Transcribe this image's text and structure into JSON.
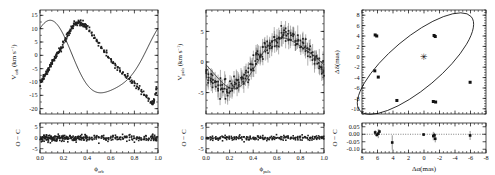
{
  "figure": {
    "type": "multi-panel-scientific-figure",
    "panel_count": 3,
    "marker_color": "#1f1f1f",
    "curve_color": "#000000",
    "background": "#ffffff"
  },
  "chart_data": [
    {
      "type": "scatter",
      "id": "orbital-radial-velocity",
      "title": "",
      "xlabel": "ϕ",
      "xlabel_sub": "orb",
      "ylabel": "V",
      "ylabel_sub": "orb",
      "ylabel_unit": " (km s",
      "ylabel_unit_sup": "−1",
      "ylabel_unit_tail": ")",
      "xlim": [
        0.0,
        1.0
      ],
      "ylim": [
        -22,
        17
      ],
      "xticks": [
        "0.0",
        "0.2",
        "0.4",
        "0.6",
        "0.8",
        "1.0"
      ],
      "xtick_values": [
        0.0,
        0.2,
        0.4,
        0.6,
        0.8,
        1.0
      ],
      "yticks": [
        "15",
        "10",
        "5",
        "0",
        "-5",
        "-10",
        "-15",
        "-20"
      ],
      "ytick_values": [
        15,
        10,
        5,
        0,
        -5,
        -10,
        -15,
        -20
      ],
      "grid": false,
      "legend": false,
      "model_curve": {
        "description": "eccentric orbit radial velocity curve",
        "amplitude": 15.5,
        "gamma": -2.5,
        "phase_offset": 0.07,
        "eccentricity": 0.25
      },
      "points": [
        {
          "x": 0.005,
          "y": -10.4
        },
        {
          "x": 0.012,
          "y": -9.9
        },
        {
          "x": 0.02,
          "y": -9.2
        },
        {
          "x": 0.028,
          "y": -8.6
        },
        {
          "x": 0.035,
          "y": -8.0
        },
        {
          "x": 0.043,
          "y": -7.4
        },
        {
          "x": 0.05,
          "y": -6.8
        },
        {
          "x": 0.058,
          "y": -6.2
        },
        {
          "x": 0.066,
          "y": -5.6
        },
        {
          "x": 0.074,
          "y": -5.0
        },
        {
          "x": 0.082,
          "y": -4.4
        },
        {
          "x": 0.09,
          "y": -3.8
        },
        {
          "x": 0.098,
          "y": -3.1
        },
        {
          "x": 0.106,
          "y": -2.6
        },
        {
          "x": 0.114,
          "y": -2.0
        },
        {
          "x": 0.122,
          "y": -1.4
        },
        {
          "x": 0.13,
          "y": -0.8
        },
        {
          "x": 0.14,
          "y": 0.0
        },
        {
          "x": 0.15,
          "y": 0.7
        },
        {
          "x": 0.16,
          "y": 1.5
        },
        {
          "x": 0.17,
          "y": 2.2
        },
        {
          "x": 0.18,
          "y": 3.0
        },
        {
          "x": 0.19,
          "y": 3.8
        },
        {
          "x": 0.2,
          "y": 4.6
        },
        {
          "x": 0.21,
          "y": 5.5
        },
        {
          "x": 0.22,
          "y": 6.3
        },
        {
          "x": 0.23,
          "y": 7.2
        },
        {
          "x": 0.24,
          "y": 8.0
        },
        {
          "x": 0.25,
          "y": 8.8
        },
        {
          "x": 0.26,
          "y": 9.5
        },
        {
          "x": 0.27,
          "y": 10.2
        },
        {
          "x": 0.28,
          "y": 10.8
        },
        {
          "x": 0.29,
          "y": 11.3
        },
        {
          "x": 0.3,
          "y": 11.7
        },
        {
          "x": 0.31,
          "y": 12.0
        },
        {
          "x": 0.32,
          "y": 12.2
        },
        {
          "x": 0.33,
          "y": 12.3
        },
        {
          "x": 0.34,
          "y": 12.3
        },
        {
          "x": 0.35,
          "y": 12.2
        },
        {
          "x": 0.36,
          "y": 12.0
        },
        {
          "x": 0.37,
          "y": 11.7
        },
        {
          "x": 0.38,
          "y": 11.3
        },
        {
          "x": 0.39,
          "y": 10.9
        },
        {
          "x": 0.4,
          "y": 10.4
        },
        {
          "x": 0.42,
          "y": 9.3
        },
        {
          "x": 0.44,
          "y": 8.1
        },
        {
          "x": 0.46,
          "y": 6.8
        },
        {
          "x": 0.48,
          "y": 5.5
        },
        {
          "x": 0.5,
          "y": 4.2
        },
        {
          "x": 0.52,
          "y": 2.9
        },
        {
          "x": 0.54,
          "y": 1.6
        },
        {
          "x": 0.56,
          "y": 0.4
        },
        {
          "x": 0.58,
          "y": -0.8
        },
        {
          "x": 0.6,
          "y": -1.9
        },
        {
          "x": 0.62,
          "y": -2.9
        },
        {
          "x": 0.64,
          "y": -3.9
        },
        {
          "x": 0.66,
          "y": -4.8
        },
        {
          "x": 0.68,
          "y": -5.7
        },
        {
          "x": 0.7,
          "y": -6.5
        },
        {
          "x": 0.72,
          "y": -7.3
        },
        {
          "x": 0.74,
          "y": -8.1
        },
        {
          "x": 0.76,
          "y": -8.9
        },
        {
          "x": 0.78,
          "y": -9.7
        },
        {
          "x": 0.8,
          "y": -10.6
        },
        {
          "x": 0.82,
          "y": -11.5
        },
        {
          "x": 0.84,
          "y": -12.5
        },
        {
          "x": 0.86,
          "y": -13.5
        },
        {
          "x": 0.88,
          "y": -14.6
        },
        {
          "x": 0.9,
          "y": -15.7
        },
        {
          "x": 0.92,
          "y": -16.8
        },
        {
          "x": 0.94,
          "y": -17.6
        },
        {
          "x": 0.95,
          "y": -17.9
        },
        {
          "x": 0.96,
          "y": -17.6
        },
        {
          "x": 0.97,
          "y": -16.6
        },
        {
          "x": 0.98,
          "y": -14.8
        },
        {
          "x": 0.99,
          "y": -12.6
        }
      ],
      "scatter_sigma": 0.9,
      "cluster_density": 4,
      "residual": {
        "ylabel": "O − C",
        "ylim": [
          -7,
          7
        ],
        "yticks": [
          "5",
          "0",
          "-5"
        ],
        "ytick_values": [
          5,
          0,
          -5
        ],
        "rms": 1.3
      }
    },
    {
      "type": "scatter",
      "id": "pulsation-radial-velocity",
      "title": "",
      "xlabel": "ϕ",
      "xlabel_sub": "puls",
      "ylabel": "V",
      "ylabel_sub": "puls",
      "ylabel_unit": " (km s",
      "ylabel_unit_sup": "−1",
      "ylabel_unit_tail": ")",
      "xlim": [
        0.0,
        1.0
      ],
      "ylim": [
        -8.5,
        8.5
      ],
      "xticks": [
        "0.0",
        "0.2",
        "0.4",
        "0.6",
        "0.8",
        "1.0"
      ],
      "xtick_values": [
        0.0,
        0.2,
        0.4,
        0.6,
        0.8,
        1.0
      ],
      "yticks": [
        "5",
        "0",
        "-5"
      ],
      "ytick_values": [
        5,
        0,
        -5
      ],
      "grid": false,
      "legend": false,
      "model_curve": {
        "description": "pulsational radial velocity curve",
        "amplitude": 4.3,
        "mean": 0.1,
        "min_phase": 0.2,
        "max_phase": 0.7
      },
      "points": [
        {
          "x": 0.005,
          "y": -1.9
        },
        {
          "x": 0.02,
          "y": -2.3
        },
        {
          "x": 0.04,
          "y": -2.8
        },
        {
          "x": 0.06,
          "y": -3.2
        },
        {
          "x": 0.08,
          "y": -3.6
        },
        {
          "x": 0.1,
          "y": -3.9
        },
        {
          "x": 0.12,
          "y": -4.1
        },
        {
          "x": 0.14,
          "y": -4.3
        },
        {
          "x": 0.16,
          "y": -4.4
        },
        {
          "x": 0.18,
          "y": -4.4
        },
        {
          "x": 0.2,
          "y": -4.3
        },
        {
          "x": 0.22,
          "y": -4.2
        },
        {
          "x": 0.24,
          "y": -4.0
        },
        {
          "x": 0.26,
          "y": -3.7
        },
        {
          "x": 0.28,
          "y": -3.3
        },
        {
          "x": 0.3,
          "y": -2.9
        },
        {
          "x": 0.32,
          "y": -2.4
        },
        {
          "x": 0.34,
          "y": -1.9
        },
        {
          "x": 0.36,
          "y": -1.4
        },
        {
          "x": 0.38,
          "y": -0.9
        },
        {
          "x": 0.4,
          "y": -0.4
        },
        {
          "x": 0.42,
          "y": 0.2
        },
        {
          "x": 0.44,
          "y": 0.7
        },
        {
          "x": 0.46,
          "y": 1.2
        },
        {
          "x": 0.48,
          "y": 1.7
        },
        {
          "x": 0.5,
          "y": 2.1
        },
        {
          "x": 0.52,
          "y": 2.5
        },
        {
          "x": 0.54,
          "y": 2.9
        },
        {
          "x": 0.56,
          "y": 3.3
        },
        {
          "x": 0.58,
          "y": 3.6
        },
        {
          "x": 0.6,
          "y": 3.8
        },
        {
          "x": 0.62,
          "y": 4.0
        },
        {
          "x": 0.64,
          "y": 4.2
        },
        {
          "x": 0.66,
          "y": 4.3
        },
        {
          "x": 0.68,
          "y": 4.4
        },
        {
          "x": 0.7,
          "y": 4.4
        },
        {
          "x": 0.72,
          "y": 4.3
        },
        {
          "x": 0.74,
          "y": 4.2
        },
        {
          "x": 0.76,
          "y": 4.0
        },
        {
          "x": 0.78,
          "y": 3.7
        },
        {
          "x": 0.8,
          "y": 3.4
        },
        {
          "x": 0.82,
          "y": 3.0
        },
        {
          "x": 0.84,
          "y": 2.6
        },
        {
          "x": 0.86,
          "y": 2.2
        },
        {
          "x": 0.88,
          "y": 1.7
        },
        {
          "x": 0.9,
          "y": 1.2
        },
        {
          "x": 0.92,
          "y": 0.6
        },
        {
          "x": 0.94,
          "y": 0.0
        },
        {
          "x": 0.96,
          "y": -0.6
        },
        {
          "x": 0.98,
          "y": -1.2
        },
        {
          "x": 0.995,
          "y": -1.7
        }
      ],
      "scatter_sigma": 1.2,
      "errorbar": 1.1,
      "cluster_density": 4,
      "residual": {
        "ylabel": "O − C",
        "ylim": [
          -7,
          7
        ],
        "yticks": [
          "5",
          "0",
          "-5"
        ],
        "ytick_values": [
          5,
          0,
          -5
        ],
        "rms": 1.0
      }
    },
    {
      "type": "scatter",
      "id": "astrometric-orbit",
      "title": "",
      "xlabel": "Δα(mas)",
      "ylabel": "Δδ(mas)",
      "xlim": [
        8,
        -8
      ],
      "ylim": [
        -11,
        9
      ],
      "xticks": [
        "8",
        "6",
        "4",
        "2",
        "0",
        "-2",
        "-4",
        "-6",
        "-8"
      ],
      "xtick_values": [
        8,
        6,
        4,
        2,
        0,
        -2,
        -4,
        -6,
        -8
      ],
      "yticks": [
        "8",
        "6",
        "4",
        "2",
        "0",
        "-2",
        "-4",
        "-6",
        "-8",
        "-10"
      ],
      "ytick_values": [
        8,
        6,
        4,
        2,
        0,
        -2,
        -4,
        -6,
        -8,
        -10
      ],
      "grid": false,
      "legend": false,
      "ellipse": {
        "center_x": 1.1,
        "center_y": -1.3,
        "semi_major": 9.4,
        "semi_minor": 4.9,
        "rotation_deg": -40
      },
      "primary_star": {
        "x": 0.0,
        "y": 0.0,
        "marker": "star",
        "color": "#b9b9b9"
      },
      "points": [
        {
          "x": 6.3,
          "y": 4.2
        },
        {
          "x": 6.1,
          "y": 4.0
        },
        {
          "x": 6.35,
          "y": -2.7
        },
        {
          "x": 5.9,
          "y": -3.9
        },
        {
          "x": -1.3,
          "y": 4.1
        },
        {
          "x": -1.45,
          "y": 3.9
        },
        {
          "x": -1.2,
          "y": -8.6
        },
        {
          "x": -1.5,
          "y": -8.7
        },
        {
          "x": 3.5,
          "y": -8.4
        },
        {
          "x": -5.95,
          "y": -4.9
        }
      ],
      "residual": {
        "ylabel": "O − C",
        "ylim": [
          -0.125,
          0.075
        ],
        "yticks": [
          "0.05",
          "0.00",
          "-0.05",
          "-0.10"
        ],
        "ytick_values": [
          0.05,
          0.0,
          -0.05,
          -0.1
        ],
        "points": [
          {
            "x": 6.3,
            "y": 0.012,
            "err": 0.015
          },
          {
            "x": 6.1,
            "y": -0.004,
            "err": 0.012
          },
          {
            "x": 5.9,
            "y": 0.004,
            "err": 0.03
          },
          {
            "x": 5.75,
            "y": 0.018,
            "err": 0.013
          },
          {
            "x": 4.1,
            "y": -0.055,
            "err": 0.048
          },
          {
            "x": 0.05,
            "y": -0.002,
            "err": 0.01
          },
          {
            "x": -1.2,
            "y": -0.012,
            "err": 0.028
          },
          {
            "x": -1.45,
            "y": -0.03,
            "err": 0.024
          },
          {
            "x": -1.35,
            "y": -0.006,
            "err": 0.016
          },
          {
            "x": -5.95,
            "y": -0.008,
            "err": 0.03
          }
        ]
      }
    }
  ]
}
